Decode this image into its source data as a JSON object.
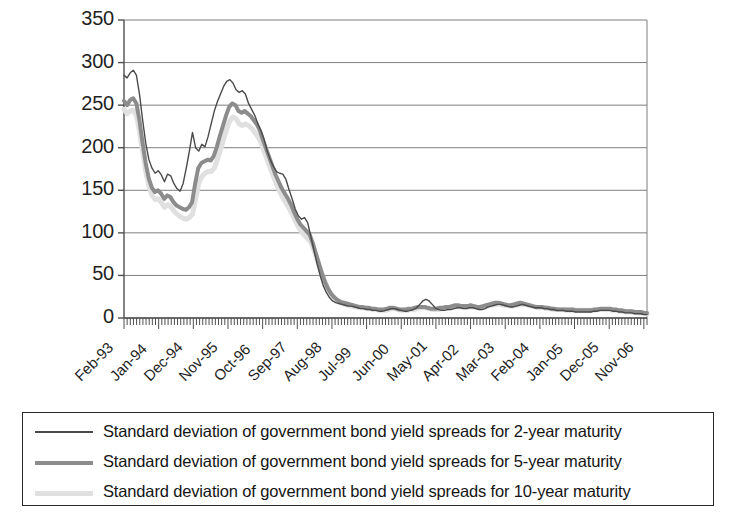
{
  "chart_data": {
    "type": "line",
    "title": "",
    "xlabel": "",
    "ylabel": "",
    "ylim": [
      0,
      350
    ],
    "ytick_values": [
      0,
      50,
      100,
      150,
      200,
      250,
      300,
      350
    ],
    "ytick_labels": [
      "0",
      "50",
      "100",
      "150",
      "200",
      "250",
      "300",
      "350"
    ],
    "grid": "horizontal",
    "legend_position": "below-plot",
    "x_tick_labels": [
      "Feb-93",
      "Jan-94",
      "Dec-94",
      "Nov-95",
      "Oct-96",
      "Sep-97",
      "Aug-98",
      "Jul-99",
      "Jun-00",
      "May-01",
      "Apr-02",
      "Mar-03",
      "Feb-04",
      "Jan-05",
      "Dec-05",
      "Nov-06"
    ],
    "x_tick_interval_months": 11,
    "x_start_label": "Feb-93",
    "x_end_label": "Nov-06",
    "n_points": 167,
    "colors": {
      "series_2y": "#4a4a4a",
      "series_5y": "#8c8c8c",
      "series_10y": "#e0e0e0",
      "grid": "#7f7f7f",
      "axis": "#4f4f4f",
      "text": "#1a1a1a",
      "background": "#ffffff"
    },
    "series": [
      {
        "name": "Standard deviation of government bond yield spreads for 2-year maturity",
        "key": "series_2y",
        "color": "#4a4a4a",
        "width": 1.4,
        "values": [
          285,
          282,
          288,
          291,
          285,
          262,
          232,
          205,
          186,
          176,
          170,
          173,
          168,
          160,
          169,
          167,
          158,
          152,
          149,
          158,
          176,
          196,
          218,
          200,
          196,
          204,
          201,
          213,
          228,
          243,
          254,
          263,
          272,
          278,
          280,
          276,
          268,
          265,
          267,
          263,
          252,
          245,
          238,
          228,
          220,
          210,
          196,
          186,
          178,
          172,
          170,
          169,
          163,
          151,
          140,
          128,
          120,
          116,
          118,
          112,
          96,
          80,
          64,
          50,
          38,
          30,
          24,
          20,
          18,
          17,
          16,
          15,
          14,
          14,
          13,
          12,
          11,
          11,
          10,
          10,
          9,
          9,
          8,
          8,
          9,
          10,
          11,
          11,
          10,
          9,
          8,
          8,
          9,
          10,
          12,
          16,
          20,
          22,
          20,
          16,
          12,
          10,
          9,
          9,
          10,
          10,
          11,
          12,
          12,
          11,
          11,
          12,
          12,
          11,
          10,
          10,
          11,
          13,
          14,
          15,
          16,
          16,
          15,
          14,
          13,
          13,
          14,
          15,
          16,
          15,
          14,
          13,
          12,
          12,
          12,
          11,
          11,
          10,
          10,
          9,
          9,
          9,
          8,
          8,
          8,
          7,
          7,
          7,
          7,
          7,
          7,
          8,
          8,
          9,
          9,
          9,
          9,
          8,
          8,
          7,
          7,
          6,
          6,
          6,
          5,
          5,
          5,
          4,
          4
        ]
      },
      {
        "name": "Standard deviation of government bond yield spreads for 5-year maturity",
        "key": "series_5y",
        "color": "#8c8c8c",
        "width": 4.0,
        "values": [
          255,
          250,
          256,
          258,
          252,
          232,
          206,
          182,
          164,
          153,
          148,
          150,
          146,
          140,
          144,
          142,
          136,
          132,
          130,
          128,
          127,
          130,
          136,
          158,
          176,
          182,
          184,
          186,
          185,
          190,
          201,
          214,
          226,
          238,
          248,
          252,
          250,
          243,
          241,
          243,
          240,
          237,
          232,
          227,
          219,
          208,
          198,
          188,
          178,
          168,
          160,
          152,
          146,
          140,
          133,
          124,
          116,
          110,
          106,
          102,
          98,
          88,
          76,
          64,
          52,
          42,
          34,
          28,
          24,
          21,
          19,
          18,
          17,
          16,
          15,
          14,
          13,
          13,
          12,
          12,
          11,
          11,
          10,
          10,
          10,
          11,
          12,
          12,
          11,
          10,
          10,
          10,
          11,
          11,
          12,
          13,
          13,
          13,
          12,
          11,
          11,
          11,
          12,
          12,
          13,
          13,
          14,
          15,
          15,
          14,
          14,
          14,
          15,
          14,
          13,
          13,
          14,
          15,
          16,
          17,
          18,
          18,
          17,
          16,
          15,
          15,
          16,
          17,
          18,
          17,
          16,
          15,
          14,
          13,
          13,
          13,
          12,
          12,
          11,
          11,
          10,
          10,
          10,
          10,
          10,
          10,
          9,
          9,
          9,
          9,
          9,
          9,
          10,
          10,
          11,
          11,
          11,
          11,
          10,
          10,
          9,
          9,
          8,
          8,
          8,
          7,
          7,
          7,
          6,
          6
        ]
      },
      {
        "name": "Standard deviation of government bond yield spreads for 10-year maturity",
        "key": "series_10y",
        "color": "#e0e0e0",
        "width": 5.0,
        "values": [
          245,
          240,
          243,
          244,
          238,
          219,
          195,
          172,
          155,
          144,
          139,
          140,
          136,
          130,
          133,
          131,
          126,
          122,
          119,
          117,
          116,
          118,
          122,
          140,
          158,
          166,
          170,
          172,
          172,
          176,
          186,
          198,
          210,
          222,
          232,
          236,
          234,
          228,
          226,
          228,
          226,
          223,
          218,
          213,
          206,
          196,
          186,
          176,
          166,
          157,
          149,
          141,
          135,
          129,
          122,
          114,
          107,
          101,
          97,
          93,
          89,
          80,
          69,
          58,
          47,
          38,
          31,
          26,
          22,
          19,
          17,
          16,
          15,
          14,
          13,
          13,
          12,
          12,
          11,
          11,
          10,
          10,
          9,
          9,
          9,
          10,
          11,
          11,
          10,
          9,
          9,
          9,
          10,
          10,
          11,
          12,
          12,
          12,
          11,
          10,
          10,
          10,
          11,
          11,
          12,
          12,
          13,
          13,
          13,
          13,
          13,
          13,
          13,
          13,
          12,
          12,
          13,
          14,
          15,
          16,
          16,
          16,
          15,
          15,
          14,
          14,
          15,
          16,
          16,
          16,
          15,
          14,
          13,
          12,
          12,
          12,
          11,
          11,
          10,
          10,
          10,
          10,
          9,
          9,
          9,
          9,
          9,
          9,
          9,
          9,
          9,
          9,
          10,
          10,
          10,
          10,
          10,
          9,
          9,
          8,
          8,
          7,
          7,
          7,
          7,
          6,
          6,
          6,
          5
        ]
      }
    ]
  },
  "legend": {
    "items": [
      {
        "label": "Standard deviation of government bond yield spreads for 2-year maturity",
        "series_key": "series_2y"
      },
      {
        "label": "Standard deviation of government bond yield spreads for 5-year maturity",
        "series_key": "series_5y"
      },
      {
        "label": "Standard deviation of government bond yield spreads for 10-year maturity",
        "series_key": "series_10y"
      }
    ]
  }
}
